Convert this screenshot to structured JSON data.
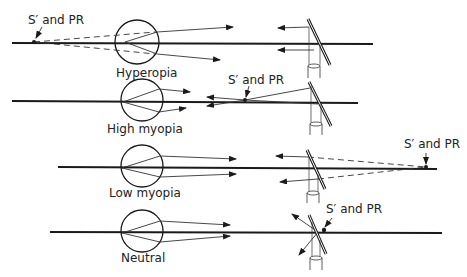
{
  "diagram": {
    "rows": [
      {
        "name": "hyperopia",
        "caption": "Hyperopia",
        "point_label": "S′ and PR"
      },
      {
        "name": "high-myopia",
        "caption": "High myopia",
        "point_label": "S′ and PR"
      },
      {
        "name": "low-myopia",
        "caption": "Low myopia",
        "point_label": "S′ and PR"
      },
      {
        "name": "neutral",
        "caption": "Neutral",
        "point_label": "S′ and PR"
      }
    ],
    "colors": {
      "line": "#1a1a1a",
      "text": "#222222",
      "background": "#ffffff"
    }
  }
}
